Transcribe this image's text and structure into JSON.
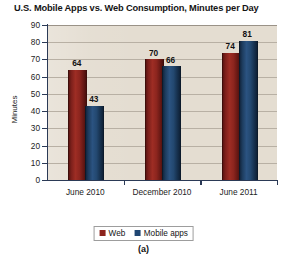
{
  "chart_data": {
    "type": "bar",
    "title": "U.S. Mobile Apps vs. Web Consumption, Minutes per Day",
    "xlabel": "",
    "ylabel": "Minutes",
    "categories": [
      "June 2010",
      "December 2010",
      "June 2011"
    ],
    "series": [
      {
        "name": "Web",
        "values": [
          64,
          70,
          74
        ],
        "color": "#8c241c"
      },
      {
        "name": "Mobile apps",
        "values": [
          43,
          66,
          81
        ],
        "color": "#1f4672"
      }
    ],
    "ylim": [
      0,
      90
    ],
    "ytick_step": 10,
    "yticks": [
      0,
      10,
      20,
      30,
      40,
      50,
      60,
      70,
      80,
      90
    ],
    "ytick_labels": [
      "0",
      "10",
      "20",
      "30",
      "40",
      "50",
      "60",
      "70",
      "80",
      "90"
    ],
    "grid": true,
    "grid_axis": "y",
    "legend_position": "bottom-center",
    "data_labels": true,
    "plot_background": "#e4ddd1",
    "page_background": "#ffffff"
  },
  "caption": "(a)",
  "legend": {
    "items": [
      {
        "label": "Web"
      },
      {
        "label": "Mobile apps"
      }
    ]
  }
}
